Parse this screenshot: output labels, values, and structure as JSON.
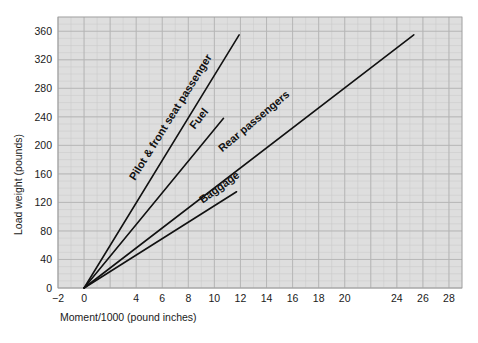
{
  "chart_data": {
    "type": "line",
    "title": "",
    "xlabel": "Moment/1000 (pound inches)",
    "ylabel": "Load weight (pounds)",
    "xlim": [
      -2,
      29
    ],
    "ylim": [
      0,
      380
    ],
    "grid": true,
    "legend_position": "inline-labels",
    "x_ticks": [
      -2,
      0,
      2,
      4,
      6,
      8,
      10,
      12,
      14,
      16,
      18,
      20,
      22,
      24,
      26,
      28
    ],
    "x_tick_labels": [
      "−2",
      "0",
      "",
      "4",
      "6",
      "8",
      "10",
      "12",
      "14",
      "16",
      "18",
      "20",
      "",
      "24",
      "26",
      "28"
    ],
    "y_ticks": [
      0,
      40,
      80,
      120,
      160,
      200,
      240,
      280,
      320,
      360
    ],
    "y_tick_labels": [
      "0",
      "40",
      "80",
      "120",
      "160",
      "200",
      "240",
      "280",
      "320",
      "360"
    ],
    "x_minor_step": 1,
    "y_minor_step": 10,
    "series": [
      {
        "name": "Pilot & front seat passenger",
        "label": "Pilot & front seat passenger",
        "x": [
          0,
          11.9
        ],
        "y": [
          0,
          355
        ],
        "slope_pounds_per_moment_unit": 29.8,
        "label_angle_deg": -58,
        "label_x": 3.9,
        "label_y": 150
      },
      {
        "name": "Fuel",
        "label": "Fuel",
        "x": [
          0,
          10.7
        ],
        "y": [
          0,
          238
        ],
        "slope_pounds_per_moment_unit": 22.2,
        "label_angle_deg": -52,
        "label_x": 8.5,
        "label_y": 222
      },
      {
        "name": "Rear passengers",
        "label": "Rear passengers",
        "x": [
          0,
          25.3
        ],
        "y": [
          0,
          355
        ],
        "slope_pounds_per_moment_unit": 14.0,
        "label_angle_deg": -40,
        "label_x": 10.6,
        "label_y": 190
      },
      {
        "name": "Baggage",
        "label": "Baggage",
        "x": [
          0,
          11.7
        ],
        "y": [
          0,
          135
        ],
        "slope_pounds_per_moment_unit": 11.5,
        "label_angle_deg": -36,
        "label_x": 9.1,
        "label_y": 118
      }
    ],
    "colors": {
      "plot_background": "#dedede",
      "figure_background": "#ffffff",
      "line": "#111111",
      "minor_grid": "#c9c9c9",
      "major_grid": "#b4b4b4",
      "text": "#1a1a1a"
    }
  }
}
